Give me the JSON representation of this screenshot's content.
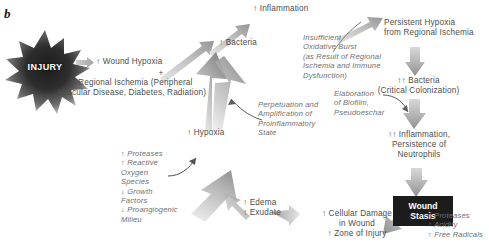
{
  "figure": {
    "panel_letter": "b",
    "injury_label": "INJURY"
  },
  "nodes": {
    "wound_hypoxia": "↑ Wound Hypoxia",
    "plus": "+",
    "regional_ischemia": "↑ Regional Ischemia (Peripheral\nVascular Disease, Diabetes, Radiation)",
    "bacteria": "↑ Bacteria",
    "inflammation": "↑ Inflammation",
    "hypoxia": "↑ Hypoxia",
    "persistent_hypoxia": "Persistent Hypoxia\nfrom Regional Ischemia",
    "bacteria_critical": "↑↑ Bacteria\n(Critical Colonization)",
    "inflammation_neutrophils": "↑↑ Inflammation,\nPersistence of\nNeutrophils",
    "wound_stasis": "Wound\nStasis",
    "proteases_acidity": "↑ Proteases\n↑ Acidity\n↑ Free Radicals",
    "cellular_damage": "↑ Cellular Damage\nin Wound\n↑ Zone of Injury",
    "edema_exudate": "↑ Edema\n↑ Exudate",
    "mediators": "↑ Proteases\n↑ Reactive\n     Oxygen\n     Species\n↓ Growth\n     Factors\n↓ Proangiogenic\n     Milieu"
  },
  "annotations": {
    "insufficient_oxidative_burst": "Insufficient\nOxidative Burst\n(as Result of Regional\nIschemia and Immune\nDysfunction)",
    "perpetuation": "Perpetuation and\nAmplification of\nProinflammatory\nState",
    "biofilm": "Elaboration\nof Biofilm,\nPseudoeschar"
  },
  "colors": {
    "arrow_gray": "#b9b9b9",
    "arrow_gray_dark": "#8e8e8e",
    "text_gray": "#4e4e4e",
    "italic_gray": "#6f6f6f",
    "box_black": "#1c1c1c",
    "burst_dark": "#2b2b2b"
  }
}
